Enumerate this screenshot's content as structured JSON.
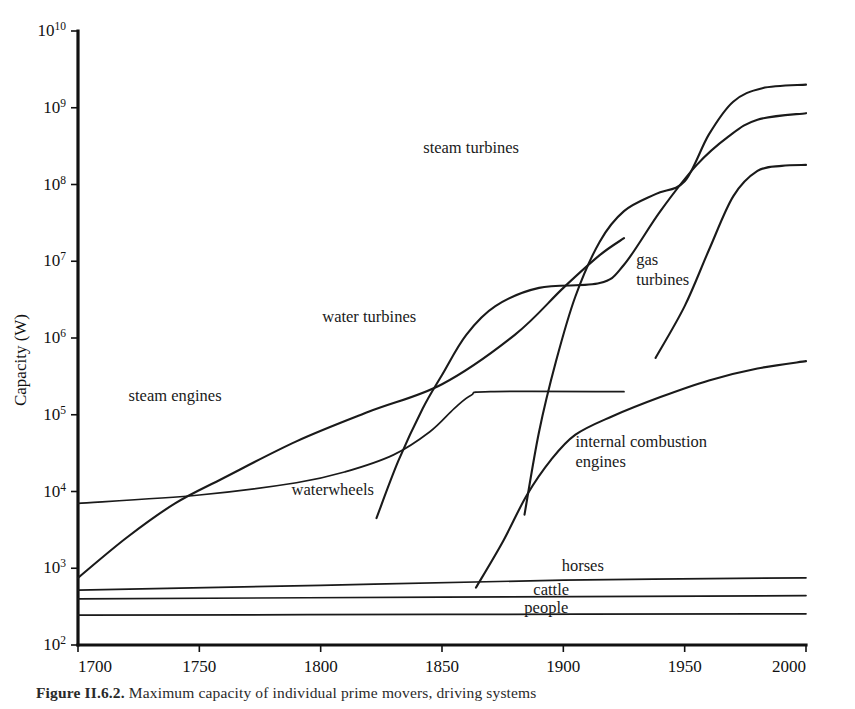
{
  "figure": {
    "caption_prefix": "Figure II.6.2.",
    "caption_text": "Maximum capacity of individual prime movers, driving systems"
  },
  "chart_data": {
    "type": "line",
    "title": "",
    "xlabel": "",
    "ylabel": "Capacity (W)",
    "xlim": [
      1700,
      2000
    ],
    "ylim": [
      100,
      10000000000
    ],
    "yscale": "log",
    "xscale": "linear",
    "grid": false,
    "legend_position": "inline-annotations",
    "xticks": [
      1700,
      1750,
      1800,
      1850,
      1900,
      1950,
      2000
    ],
    "xtick_labels": [
      "1700",
      "1750",
      "1800",
      "1850",
      "1900",
      "1950",
      "2000"
    ],
    "yticks": [
      100,
      1000,
      10000,
      100000,
      1000000,
      10000000,
      100000000,
      1000000000,
      10000000000
    ],
    "ytick_labels": [
      "10^2",
      "10^3",
      "10^4",
      "10^5",
      "10^6",
      "10^7",
      "10^8",
      "10^9",
      "10^10"
    ],
    "ytick_mantissa": "10",
    "ytick_exponents": [
      "2",
      "3",
      "4",
      "5",
      "6",
      "7",
      "8",
      "9",
      "10"
    ],
    "series": [
      {
        "name": "waterwheels",
        "label": "waterwheels",
        "label_x": 1805,
        "label_y": 9000,
        "points": [
          [
            1700,
            7000
          ],
          [
            1750,
            9000
          ],
          [
            1790,
            13000
          ],
          [
            1810,
            18000
          ],
          [
            1830,
            30000
          ],
          [
            1845,
            60000
          ],
          [
            1855,
            120000
          ],
          [
            1862,
            180000
          ],
          [
            1870,
            200000
          ],
          [
            1925,
            200000
          ]
        ]
      },
      {
        "name": "steam engines",
        "label": "steam engines",
        "label_x": 1740,
        "label_y": 150000,
        "points": [
          [
            1700,
            750
          ],
          [
            1720,
            2500
          ],
          [
            1740,
            7000
          ],
          [
            1760,
            15000
          ],
          [
            1790,
            45000
          ],
          [
            1820,
            110000
          ],
          [
            1850,
            250000
          ],
          [
            1880,
            1100000
          ],
          [
            1900,
            4500000
          ],
          [
            1915,
            12000000
          ],
          [
            1925,
            20000000
          ]
        ]
      },
      {
        "name": "water turbines",
        "label": "water turbines",
        "label_x": 1820,
        "label_y": 1600000,
        "points": [
          [
            1823,
            4500
          ],
          [
            1832,
            25000
          ],
          [
            1842,
            120000
          ],
          [
            1850,
            330000
          ],
          [
            1860,
            1100000
          ],
          [
            1872,
            2600000
          ],
          [
            1890,
            4500000
          ],
          [
            1915,
            5200000
          ],
          [
            1925,
            9000000
          ],
          [
            1940,
            45000000
          ],
          [
            1955,
            180000000
          ],
          [
            1968,
            420000000
          ],
          [
            1980,
            700000000
          ],
          [
            2000,
            850000000
          ]
        ]
      },
      {
        "name": "steam turbines",
        "label": "steam turbines",
        "label_x": 1862,
        "label_y": 260000000,
        "points": [
          [
            1884,
            5000
          ],
          [
            1890,
            60000
          ],
          [
            1897,
            500000
          ],
          [
            1905,
            3500000
          ],
          [
            1915,
            18000000
          ],
          [
            1925,
            45000000
          ],
          [
            1938,
            75000000
          ],
          [
            1950,
            110000000
          ],
          [
            1960,
            450000000
          ],
          [
            1970,
            1200000000
          ],
          [
            1982,
            1800000000
          ],
          [
            2000,
            2000000000
          ]
        ]
      },
      {
        "name": "gas turbines",
        "label": "gas turbines",
        "label_x": 1930,
        "label_y": 9000000,
        "points": [
          [
            1938,
            550000
          ],
          [
            1950,
            2600000
          ],
          [
            1960,
            14000000
          ],
          [
            1970,
            70000000
          ],
          [
            1980,
            150000000
          ],
          [
            1990,
            175000000
          ],
          [
            2000,
            180000000
          ]
        ]
      },
      {
        "name": "internal combustion engines",
        "label": "internal combustion engines",
        "label_x": 1905,
        "label_y": 38000,
        "points": [
          [
            1864,
            560
          ],
          [
            1875,
            2200
          ],
          [
            1885,
            9000
          ],
          [
            1895,
            26000
          ],
          [
            1905,
            55000
          ],
          [
            1920,
            95000
          ],
          [
            1940,
            170000
          ],
          [
            1960,
            280000
          ],
          [
            1980,
            400000
          ],
          [
            2000,
            500000
          ]
        ]
      },
      {
        "name": "horses",
        "label": "horses",
        "label_x": 1908,
        "label_y": 930,
        "points": [
          [
            1700,
            520
          ],
          [
            1800,
            600
          ],
          [
            1900,
            700
          ],
          [
            2000,
            750
          ]
        ]
      },
      {
        "name": "cattle",
        "label": "cattle",
        "label_x": 1895,
        "label_y": 450,
        "points": [
          [
            1700,
            400
          ],
          [
            1850,
            420
          ],
          [
            2000,
            440
          ]
        ]
      },
      {
        "name": "people",
        "label": "people",
        "label_x": 1893,
        "label_y": 265,
        "points": [
          [
            1700,
            245
          ],
          [
            1850,
            250
          ],
          [
            2000,
            255
          ]
        ]
      }
    ]
  }
}
